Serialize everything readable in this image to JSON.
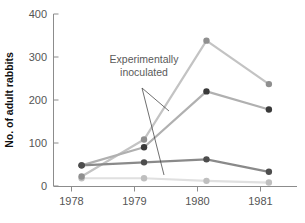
{
  "chart_data": {
    "type": "line",
    "title": "",
    "xlabel": "",
    "ylabel": "No. of adult rabbits",
    "x": [
      1978,
      1979,
      1980,
      1981
    ],
    "xtick_labels": [
      "1978",
      "1979",
      "1980",
      "1981"
    ],
    "ytick_labels": [
      "0",
      "100",
      "200",
      "300",
      "400"
    ],
    "ytick_values": [
      0,
      100,
      200,
      300,
      400
    ],
    "ylim": [
      0,
      400
    ],
    "xlim": [
      1977.55,
      1981.45
    ],
    "grid": false,
    "legend": null,
    "annotations": [
      {
        "name": "experimentally-inoculated",
        "line1": "Experimentally",
        "line2": "inoculated",
        "x": 1979.05,
        "y": 318
      }
    ],
    "series": [
      {
        "name": "series-light-gray",
        "color": "#c3c3c3",
        "marker_color": "#8f8f8f",
        "values": [
          22,
          108,
          338,
          237
        ]
      },
      {
        "name": "series-dark",
        "color": "#b0b0b0",
        "marker_color": "#3a3a3a",
        "values": [
          48,
          90,
          220,
          178
        ]
      },
      {
        "name": "series-medium-gray",
        "color": "#8a8a8a",
        "marker_color": "#4d4d4d",
        "values": [
          48,
          55,
          62,
          33
        ]
      },
      {
        "name": "series-very-light",
        "color": "#e0e0e0",
        "marker_color": "#bfbfbf",
        "values": [
          18,
          18,
          12,
          8
        ]
      }
    ]
  }
}
